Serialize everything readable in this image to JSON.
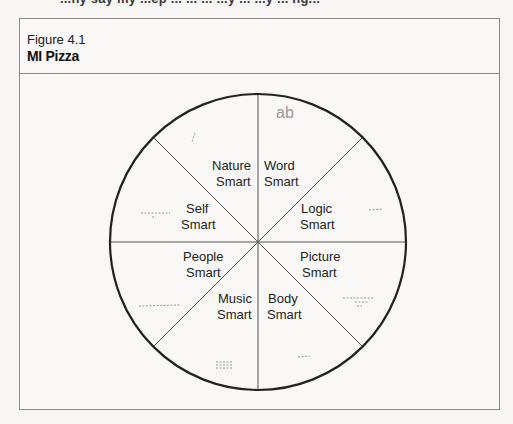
{
  "figure": {
    "number_label": "Figure 4.1",
    "title": "MI Pizza"
  },
  "bleed_text": "...ny say my ...ep ... ... ... ...y ... ...y ... ng...",
  "diagram": {
    "type": "pie-diagram",
    "center": [
      258,
      242
    ],
    "radius": 148,
    "slices": [
      {
        "name": "Nature Smart",
        "line1": "Nature",
        "line2": "Smart"
      },
      {
        "name": "Word Smart",
        "line1": "Word",
        "line2": "Smart"
      },
      {
        "name": "Logic Smart",
        "line1": "Logic",
        "line2": "Smart"
      },
      {
        "name": "Picture Smart",
        "line1": "Picture",
        "line2": "Smart"
      },
      {
        "name": "Body Smart",
        "line1": "Body",
        "line2": "Smart"
      },
      {
        "name": "Music Smart",
        "line1": "Music",
        "line2": "Smart"
      },
      {
        "name": "People Smart",
        "line1": "People",
        "line2": "Smart"
      },
      {
        "name": "Self Smart",
        "line1": "Self",
        "line2": "Smart"
      }
    ],
    "line_color": "#222222",
    "divider_color": "#555555"
  }
}
